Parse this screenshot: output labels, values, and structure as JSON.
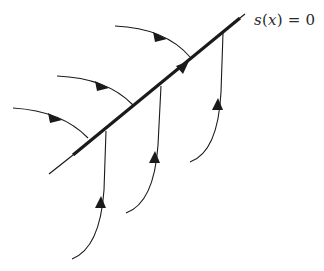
{
  "diagram": {
    "surface_label": {
      "func": "s",
      "open": "(",
      "var": "x",
      "close": ")",
      "rest": " = 0",
      "full": "s(x) = 0"
    },
    "colors": {
      "stroke": "#1a1a1a",
      "background": "#ffffff"
    },
    "surface": {
      "thin_start": [
        49,
        174
      ],
      "thick_start": [
        73,
        155
      ],
      "thick_end": [
        240,
        18
      ],
      "thin_end": [
        245,
        14
      ],
      "arrow": [
        181,
        68
      ]
    },
    "trajectories_above": [
      {
        "start": [
          115,
          26
        ],
        "arrow": [
          160,
          37
        ],
        "end": [
          190,
          57
        ]
      },
      {
        "start": [
          57,
          76
        ],
        "arrow": [
          102,
          86
        ],
        "end": [
          133,
          105
        ]
      },
      {
        "start": [
          13,
          108
        ],
        "arrow": [
          55,
          118
        ],
        "end": [
          88,
          138
        ]
      }
    ],
    "trajectories_below": [
      {
        "start": [
          72,
          259
        ],
        "arrow": [
          100,
          203
        ],
        "end": [
          106,
          131
        ]
      },
      {
        "start": [
          126,
          213
        ],
        "arrow": [
          155,
          158
        ],
        "end": [
          161,
          86
        ]
      },
      {
        "start": [
          190,
          162
        ],
        "arrow": [
          218,
          105
        ],
        "end": [
          223,
          33
        ]
      }
    ]
  }
}
